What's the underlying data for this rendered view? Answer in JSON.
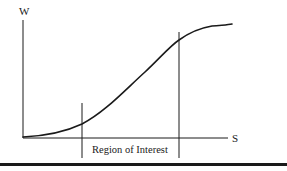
{
  "diagram": {
    "y_axis_label": "W",
    "x_axis_label": "S",
    "region_label": "Region of Interest",
    "curve_type": "sigmoid (S-shaped) curve",
    "colors": {
      "line": "#1a1a1a",
      "background": "#ffffff"
    }
  }
}
